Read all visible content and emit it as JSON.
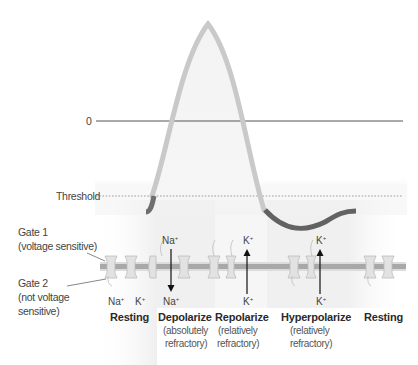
{
  "diagram": {
    "axis": {
      "zero_label": "0",
      "threshold_label": "Threshold"
    },
    "gates": {
      "gate1": {
        "label": "Gate 1",
        "sub": "(voltage sensitive)"
      },
      "gate2": {
        "label": "Gate 2",
        "sub1": "(not voltage",
        "sub2": "sensitive)"
      }
    },
    "ions": {
      "resting_na": "Na",
      "resting_k": "K",
      "depol_na_top": "Na",
      "depol_na_bottom": "Na",
      "repol_k_top": "K",
      "repol_k_bottom": "K",
      "hyper_k_top": "K",
      "hyper_k_bottom": "K",
      "charge": "+"
    },
    "stages": [
      {
        "name": "Resting",
        "sub1": "",
        "sub2": ""
      },
      {
        "name": "Depolarize",
        "sub1": "(absolutely",
        "sub2": "refractory)"
      },
      {
        "name": "Repolarize",
        "sub1": "(relatively",
        "sub2": "refractory)"
      },
      {
        "name": "Hyperpolarize",
        "sub1": "(relatively",
        "sub2": "refractory)"
      },
      {
        "name": "Resting",
        "sub1": "",
        "sub2": ""
      }
    ],
    "colors": {
      "curve_dark": "#6e6e6e",
      "curve_light": "#c8c8c8",
      "zero_line": "#555555",
      "threshold_line": "#888888",
      "membrane": "#a9a9a9",
      "channel": "#d9d9d9",
      "shade": "#ececec"
    }
  }
}
